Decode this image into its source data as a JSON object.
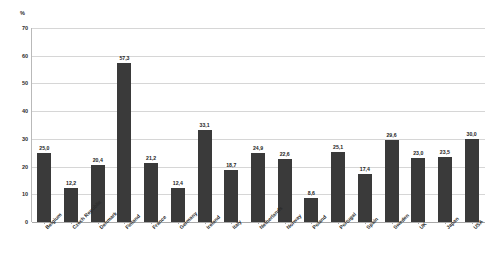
{
  "chart_data": {
    "type": "bar",
    "title": "",
    "subtitle": "",
    "xlabel": "",
    "ylabel": "%",
    "unit_label": "%",
    "ylim": [
      0,
      70
    ],
    "ytick_step": 10,
    "ytick_labels": [
      "0",
      "10",
      "20",
      "30",
      "40",
      "50",
      "60",
      "70"
    ],
    "ytick_values": [
      0,
      10,
      20,
      30,
      40,
      50,
      60,
      70
    ],
    "grid": true,
    "grid_axis": "y",
    "legend": false,
    "legend_position": "none",
    "bar_color": "#3a3a3a",
    "gridline_color": "#d6d6d6",
    "axis_color": "#a8a8a8",
    "background_color": "#ffffff",
    "decimal_separator": ",",
    "categories": [
      "Belgium",
      "Czech Republic",
      "Denmark",
      "Finland",
      "France",
      "Germany",
      "Ireland",
      "Italy",
      "Netherlands",
      "Norway",
      "Poland",
      "Portugal",
      "Spain",
      "Sweden",
      "UK",
      "Japan",
      "USA"
    ],
    "values": [
      25.0,
      12.2,
      20.4,
      57.3,
      21.2,
      12.4,
      33.1,
      18.7,
      24.9,
      22.6,
      8.6,
      25.1,
      17.4,
      29.6,
      23.0,
      23.5,
      30.0
    ],
    "value_labels": [
      "25,0",
      "12,2",
      "20,4",
      "57,3",
      "21,2",
      "12,4",
      "33,1",
      "18,7",
      "24,9",
      "22,6",
      "8,6",
      "25,1",
      "17,4",
      "29,6",
      "23,0",
      "23,5",
      "30,0"
    ],
    "data_labels_shown": true
  }
}
